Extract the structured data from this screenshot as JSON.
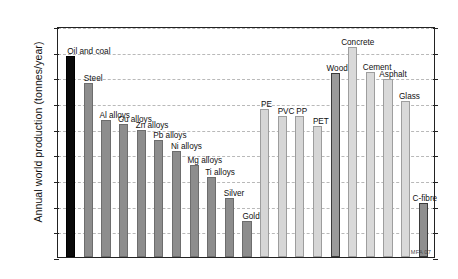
{
  "chart_data": {
    "type": "bar",
    "title": "",
    "xlabel": "",
    "ylabel": "Annual world production (tonnes/year)",
    "yscale": "log",
    "ylim": [
      100,
      100000000000
    ],
    "grid": true,
    "legend": "none",
    "ytick_labels": [
      "10²",
      "10³",
      "10⁴",
      "10⁵",
      "10⁶",
      "10⁷",
      "10⁸",
      "10⁹",
      "10¹⁰",
      "10¹¹"
    ],
    "ytick_mantissa": [
      "10",
      "10",
      "10",
      "10",
      "10",
      "10",
      "10",
      "10",
      "10",
      "10"
    ],
    "ytick_exponents": [
      "2",
      "3",
      "4",
      "5",
      "6",
      "7",
      "8",
      "9",
      "10",
      "11"
    ],
    "ytick_values": [
      100,
      1000,
      10000,
      100000,
      1000000,
      10000000,
      100000000,
      1000000000,
      10000000000,
      100000000000
    ],
    "annotation": "MFA 07",
    "categories": [
      "Oil and coal",
      "Steel",
      "Al alloys",
      "Cu alloys",
      "Zn alloys",
      "Pb alloys",
      "Ni alloys",
      "Mg alloys",
      "Ti alloys",
      "Silver",
      "Gold",
      "PE",
      "PVC",
      "PP",
      "PET",
      "Wood",
      "Concrete",
      "Cement",
      "Asphalt",
      "Glass",
      "C-fibre"
    ],
    "bars": [
      {
        "label": "Oil and coal",
        "value": 7000000000,
        "family": "fossil"
      },
      {
        "label": "Steel",
        "value": 600000000,
        "family": "metal"
      },
      {
        "label": "Al alloys",
        "value": 22000000,
        "family": "metal"
      },
      {
        "label": "Cu alloys",
        "value": 15000000,
        "family": "metal"
      },
      {
        "label": "Zn alloys",
        "value": 9000000,
        "family": "metal"
      },
      {
        "label": "Pb alloys",
        "value": 3500000,
        "family": "metal"
      },
      {
        "label": "Ni alloys",
        "value": 1400000,
        "family": "metal"
      },
      {
        "label": "Mg alloys",
        "value": 400000,
        "family": "metal"
      },
      {
        "label": "Ti alloys",
        "value": 130000,
        "family": "metal"
      },
      {
        "label": "Silver",
        "value": 20000,
        "family": "metal"
      },
      {
        "label": "Gold",
        "value": 2500,
        "family": "metal"
      },
      {
        "label": "PE",
        "value": 60000000,
        "family": "polymer"
      },
      {
        "label": "PVC",
        "value": 32000000,
        "family": "polymer"
      },
      {
        "label": "PP",
        "value": 32000000,
        "family": "polymer"
      },
      {
        "label": "PET",
        "value": 13000000,
        "family": "polymer"
      },
      {
        "label": "Wood",
        "value": 1500000000,
        "family": "natural"
      },
      {
        "label": "Concrete",
        "value": 15000000000,
        "family": "ceramic"
      },
      {
        "label": "Cement",
        "value": 1600000000,
        "family": "ceramic"
      },
      {
        "label": "Asphalt",
        "value": 900000000,
        "family": "ceramic"
      },
      {
        "label": "Glass",
        "value": 120000000,
        "family": "ceramic"
      },
      {
        "label": "C-fibre",
        "value": 13000,
        "family": "composite"
      }
    ]
  }
}
